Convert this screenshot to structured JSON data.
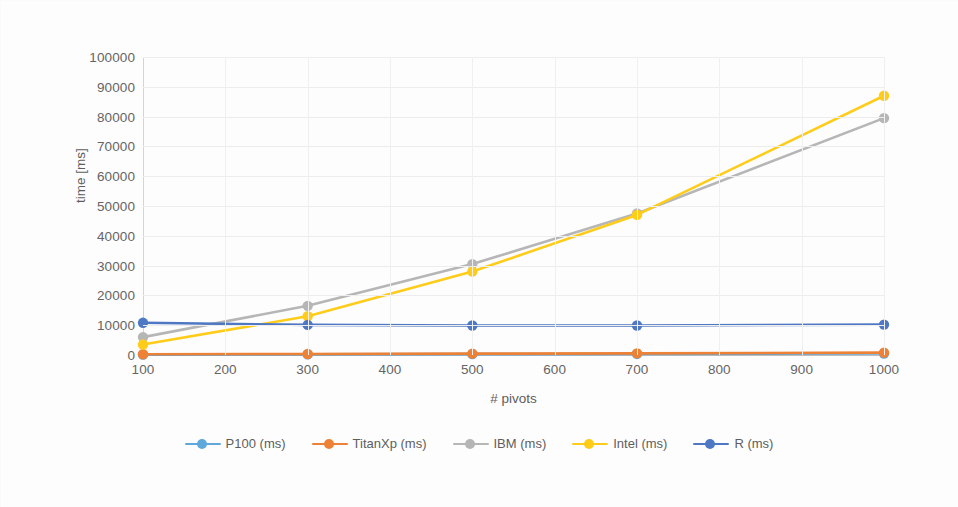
{
  "chart_data": {
    "type": "line",
    "title": "",
    "xlabel": "# pivots",
    "ylabel": "time [ms]",
    "x": [
      100,
      300,
      500,
      700,
      1000
    ],
    "xlim": [
      100,
      1000
    ],
    "ylim": [
      0,
      100000
    ],
    "xticks": [
      "100",
      "200",
      "300",
      "400",
      "500",
      "600",
      "700",
      "800",
      "900",
      "1000"
    ],
    "xtick_values": [
      100,
      200,
      300,
      400,
      500,
      600,
      700,
      800,
      900,
      1000
    ],
    "yticks": [
      "0",
      "10000",
      "20000",
      "30000",
      "40000",
      "50000",
      "60000",
      "70000",
      "80000",
      "90000",
      "100000"
    ],
    "ytick_values": [
      0,
      10000,
      20000,
      30000,
      40000,
      50000,
      60000,
      70000,
      80000,
      90000,
      100000
    ],
    "grid": true,
    "legend_position": "bottom",
    "series": [
      {
        "name": "P100 (ms)",
        "color": "#5fa8dc",
        "values": [
          120,
          200,
          280,
          360,
          480
        ]
      },
      {
        "name": "TitanXp (ms)",
        "color": "#ed8136",
        "values": [
          250,
          350,
          450,
          560,
          800
        ]
      },
      {
        "name": "IBM (ms)",
        "color": "#b6b6b6",
        "values": [
          6000,
          16500,
          30500,
          47500,
          79500
        ]
      },
      {
        "name": "Intel (ms)",
        "color": "#ffcc1a",
        "values": [
          3500,
          13000,
          28000,
          47000,
          87000
        ]
      },
      {
        "name": "R (ms)",
        "color": "#4f78c4",
        "values": [
          10800,
          10100,
          9900,
          9900,
          10200
        ]
      }
    ]
  },
  "legend": {
    "items": [
      {
        "label": "P100 (ms)"
      },
      {
        "label": "TitanXp (ms)"
      },
      {
        "label": "IBM (ms)"
      },
      {
        "label": "Intel (ms)"
      },
      {
        "label": "R (ms)"
      }
    ]
  },
  "axes": {
    "y_title": "time [ms]",
    "x_title": "# pivots"
  },
  "colors": {
    "p100": "#5fa8dc",
    "titanxp": "#ed8136",
    "ibm": "#b6b6b6",
    "intel": "#ffcc1a",
    "r": "#4f78c4",
    "grid": "#ededed",
    "axis": "#bdbdbd",
    "text": "#666464",
    "background": "#fdfdfd"
  }
}
